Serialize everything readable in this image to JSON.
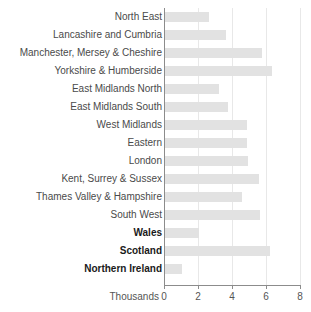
{
  "chart_data": {
    "type": "bar",
    "orientation": "horizontal",
    "title": "",
    "xlabel": "Thousands",
    "ylabel": "",
    "xlim": [
      0,
      8
    ],
    "xticks": [
      0,
      2,
      4,
      6,
      8
    ],
    "xtick_labels": [
      "0",
      "2",
      "4",
      "6",
      "8"
    ],
    "grid": true,
    "grid_axis": "x",
    "legend": false,
    "bar_color": "#e2e2e2",
    "categories": [
      "North East",
      "Lancashire and Cumbria",
      "Manchester, Mersey & Cheshire",
      "Yorkshire & Humberside",
      "East Midlands North",
      "East Midlands South",
      "West Midlands",
      "Eastern",
      "London",
      "Kent, Surrey & Sussex",
      "Thames Valley & Hampshire",
      "South West",
      "Wales",
      "Scotland",
      "Northern Ireland"
    ],
    "values": [
      2.6,
      3.6,
      5.7,
      6.3,
      3.2,
      3.7,
      4.8,
      4.8,
      4.9,
      5.5,
      4.5,
      5.6,
      2.0,
      6.2,
      1.0
    ],
    "emphasis": [
      false,
      false,
      false,
      false,
      false,
      false,
      false,
      false,
      false,
      false,
      false,
      false,
      true,
      true,
      true
    ]
  }
}
